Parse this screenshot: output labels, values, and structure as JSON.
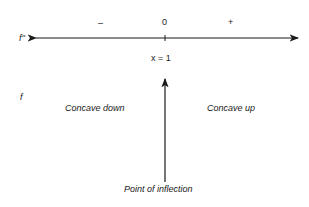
{
  "sign_chart": {
    "row_label_top": "f''",
    "row_label_bottom": "f",
    "sign_left": "–",
    "sign_center": "0",
    "sign_right": "+",
    "critical_point": "x = 1",
    "region_left": "Concave down",
    "region_right": "Concave up",
    "arrow_caption": "Point of inflection"
  }
}
